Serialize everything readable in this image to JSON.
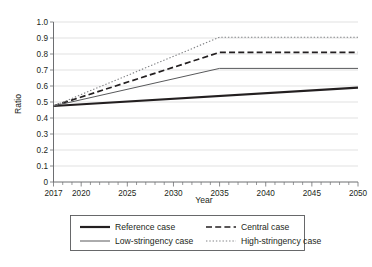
{
  "chart_data": {
    "type": "line",
    "title": "",
    "xlabel": "Year",
    "ylabel": "Ratio",
    "xlim": [
      2017,
      2050
    ],
    "ylim": [
      0,
      1.0
    ],
    "grid": "horizontal",
    "legend_position": "bottom",
    "x_ticks_major": [
      2017,
      2020,
      2025,
      2030,
      2035,
      2040,
      2045,
      2050
    ],
    "x_tick_labels": [
      "2017",
      "2020",
      "2025",
      "2030",
      "2035",
      "2040",
      "2045",
      "2050"
    ],
    "x_minor_tick_step": 1,
    "y_ticks": [
      0,
      0.1,
      0.2,
      0.3,
      0.4,
      0.5,
      0.6,
      0.7,
      0.8,
      0.9,
      1.0
    ],
    "y_tick_labels": [
      "0",
      "0.1",
      "0.2",
      "0.3",
      "0.4",
      "0.5",
      "0.6",
      "0.7",
      "0.8",
      "0.9",
      "1.0"
    ],
    "series": [
      {
        "name": "Reference case",
        "style": "solid-thick",
        "color": "#231f20",
        "width": 2.2,
        "dash": "",
        "x": [
          2017,
          2050
        ],
        "values": [
          0.475,
          0.59
        ]
      },
      {
        "name": "Central case",
        "style": "dashed",
        "color": "#231f20",
        "width": 1.7,
        "dash": "6,3.2",
        "x": [
          2017,
          2035,
          2050
        ],
        "values": [
          0.475,
          0.81,
          0.81
        ]
      },
      {
        "name": "Low-stringency case",
        "style": "solid-thin",
        "color": "#58595b",
        "width": 1.0,
        "dash": "",
        "x": [
          2017,
          2035,
          2050
        ],
        "values": [
          0.475,
          0.71,
          0.71
        ]
      },
      {
        "name": "High-stringency case",
        "style": "dotted",
        "color": "#808285",
        "width": 1.1,
        "dash": "1.4,1.9",
        "x": [
          2017,
          2035,
          2050
        ],
        "values": [
          0.475,
          0.905,
          0.905
        ]
      }
    ]
  },
  "legend": {
    "entries": [
      {
        "label": "Reference case"
      },
      {
        "label": "Central case"
      },
      {
        "label": "Low-stringency case"
      },
      {
        "label": "High-stringency case"
      }
    ]
  },
  "axes": {
    "y_title": "Ratio",
    "x_title": "Year"
  }
}
